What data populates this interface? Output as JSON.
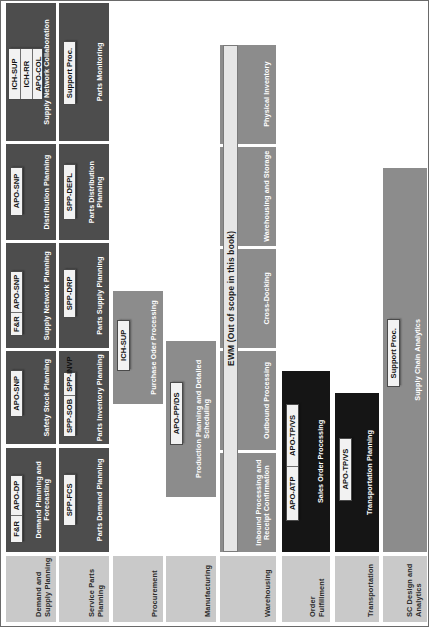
{
  "diagram": {
    "orientation": "rotated-90",
    "colors": {
      "row_label_bg": "#c9c9c9",
      "process_dark": "#4d4d4d",
      "process_mid": "#8c8c8c",
      "process_black": "#151515",
      "tag_bg": "#f2f2f2",
      "border": "#6a6a6a"
    },
    "rows": [
      {
        "label": "Demand and Supply Planning",
        "boxes": [
          {
            "label": "Demand Planning and Forecasting",
            "shade": "dark",
            "tags": [
              "F&R",
              "APO-DP"
            ],
            "tag_layout": "row"
          },
          {
            "label": "Safety Stock Planning",
            "shade": "dark",
            "tags": [
              "APO-SNP"
            ],
            "tag_layout": "row"
          },
          {
            "label": "Supply Network Planning",
            "shade": "dark",
            "tags": [
              "F&R",
              "APO-SNP"
            ],
            "tag_layout": "row"
          },
          {
            "label": "Distribution Planning",
            "shade": "dark",
            "tags": [
              "APO-SNP"
            ],
            "tag_layout": "row"
          },
          {
            "label": "Supply Network Collaboration",
            "shade": "dark",
            "tags": [
              "ICH-SUP",
              "ICH-RR",
              "APO-COL"
            ],
            "tag_layout": "stack"
          }
        ]
      },
      {
        "label": "Service Parts Planning",
        "boxes": [
          {
            "label": "Parts Demand Planning",
            "shade": "dark",
            "tags": [
              "SPP-FCS"
            ],
            "tag_layout": "row"
          },
          {
            "label": "Parts Inventory Planning",
            "shade": "dark",
            "tags": [
              "SPP-SOB",
              "SPP-INVP"
            ],
            "tag_layout": "row"
          },
          {
            "label": "Parts Supply Planning",
            "shade": "dark",
            "tags": [
              "SPP-DRP"
            ],
            "tag_layout": "row"
          },
          {
            "label": "Parts Distribution Planning",
            "shade": "dark",
            "tags": [
              "SPP-DEPL"
            ],
            "tag_layout": "row"
          },
          {
            "label": "Parts Monitoring",
            "shade": "dark",
            "tags": [
              "Support Proc."
            ],
            "tag_layout": "row"
          }
        ]
      },
      {
        "label": "Procurement",
        "boxes": [
          {
            "label": "Purchase Oder Processing",
            "shade": "mid",
            "tags": [
              "ICH-SUP"
            ],
            "tag_layout": "row"
          }
        ]
      },
      {
        "label": "Manufacturing",
        "boxes": [
          {
            "label": "Production Planning and Detailed Scheduling",
            "shade": "mid",
            "tags": [
              "APO-PP/DS"
            ],
            "tag_layout": "row"
          }
        ]
      },
      {
        "label": "Warehousing",
        "boxes": [
          {
            "label": "Inbound Processing and Receipt Confirmation",
            "shade": "mid",
            "tags": [],
            "tag_layout": "row"
          },
          {
            "label": "Outbound Processing",
            "shade": "mid",
            "tags": [],
            "tag_layout": "row"
          },
          {
            "label": "Cross-Docking",
            "shade": "mid",
            "tags": [],
            "tag_layout": "row"
          },
          {
            "label": "Warehousing and Storage",
            "shade": "mid",
            "tags": [],
            "tag_layout": "row"
          },
          {
            "label": "Physical Inventory",
            "shade": "mid",
            "tags": [],
            "tag_layout": "row"
          }
        ],
        "overlay": "EWM (Out of scope in this book)"
      },
      {
        "label": "Order Fulfillment",
        "boxes": [
          {
            "label": "Sales Order Processing",
            "shade": "black",
            "tags": [
              "APO-ATP",
              "APO-TP/VS"
            ],
            "tag_layout": "row"
          }
        ]
      },
      {
        "label": "Transportation",
        "boxes": [
          {
            "label": "Transportation Planning",
            "shade": "black",
            "tags": [
              "APO-TP/VS"
            ],
            "tag_layout": "row"
          }
        ]
      },
      {
        "label": "SC Design and Analytics",
        "boxes": [
          {
            "label": "Supply Chain Analytics",
            "shade": "mid",
            "tags": [
              "Support Proc."
            ],
            "tag_layout": "row"
          }
        ]
      }
    ]
  }
}
